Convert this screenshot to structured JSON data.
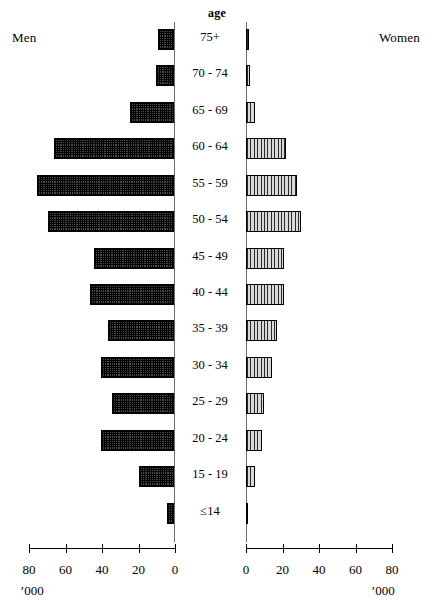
{
  "labels": {
    "men": "Men",
    "women": "Women",
    "age_heading": "age",
    "unit_left": "’000",
    "unit_right": "’000"
  },
  "axis": {
    "ticks_left": [
      "80",
      "60",
      "40",
      "20",
      "0"
    ],
    "ticks_right": [
      "0",
      "20",
      "40",
      "60",
      "80"
    ],
    "max": 80,
    "step": 20
  },
  "chart_data": {
    "type": "bar",
    "title": "",
    "subtitle": "",
    "orientation": "population-pyramid",
    "xlabel": "’000",
    "ylabel": "age",
    "xlim": [
      0,
      80
    ],
    "grid": false,
    "legend_position": "none",
    "categories": [
      "75+",
      "70 - 74",
      "65 - 69",
      "60 - 64",
      "55 - 59",
      "50 - 54",
      "45 - 49",
      "40 - 44",
      "35 - 39",
      "30 - 34",
      "25 - 29",
      "20 - 24",
      "15 - 19",
      "≤14"
    ],
    "series": [
      {
        "name": "Men",
        "side": "left",
        "values": [
          9,
          10,
          24,
          66,
          75,
          69,
          44,
          46,
          36,
          40,
          34,
          40,
          19,
          4
        ]
      },
      {
        "name": "Women",
        "side": "right",
        "values": [
          1.5,
          2,
          5,
          22,
          28,
          30,
          21,
          21,
          17,
          14,
          10,
          9,
          5,
          1
        ]
      }
    ],
    "annotations": [
      "Men",
      "Women",
      "age",
      "’000"
    ]
  }
}
